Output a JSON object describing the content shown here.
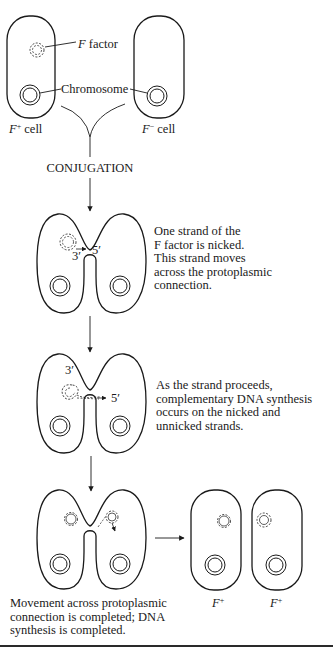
{
  "figure": {
    "top": {
      "f_factor_label": "F factor",
      "f_factor_label_italic": "F",
      "f_factor_label_rest": " factor",
      "chromosome_label": "Chromosome",
      "left_cell_label": "F",
      "left_cell_sup": "+",
      "left_cell_suffix": " cell",
      "right_cell_label": "F",
      "right_cell_sup": "−",
      "right_cell_suffix": " cell"
    },
    "process_label": "CONJUGATION",
    "stages": [
      {
        "id": "nicking",
        "labels": {
          "three_prime": "3′",
          "five_prime": "5′"
        },
        "caption_lines": [
          "One strand of the",
          "F factor is nicked.",
          "This strand moves",
          "across the protoplasmic",
          "connection."
        ]
      },
      {
        "id": "synthesis",
        "labels": {
          "three_prime": "3′",
          "five_prime": "5′"
        },
        "caption_lines": [
          "As the strand proceeds,",
          "complementary DNA synthesis",
          "occurs on the nicked and",
          "unnicked strands."
        ]
      },
      {
        "id": "completion",
        "caption_lines": [
          "Movement across protoplasmic",
          "connection is completed; DNA",
          "synthesis is completed."
        ],
        "result_cells": [
          {
            "label": "F",
            "sup": "+"
          },
          {
            "label": "F",
            "sup": "+"
          }
        ]
      }
    ],
    "colors": {
      "ink": "#1a1a1a",
      "background": "#ffffff"
    }
  }
}
